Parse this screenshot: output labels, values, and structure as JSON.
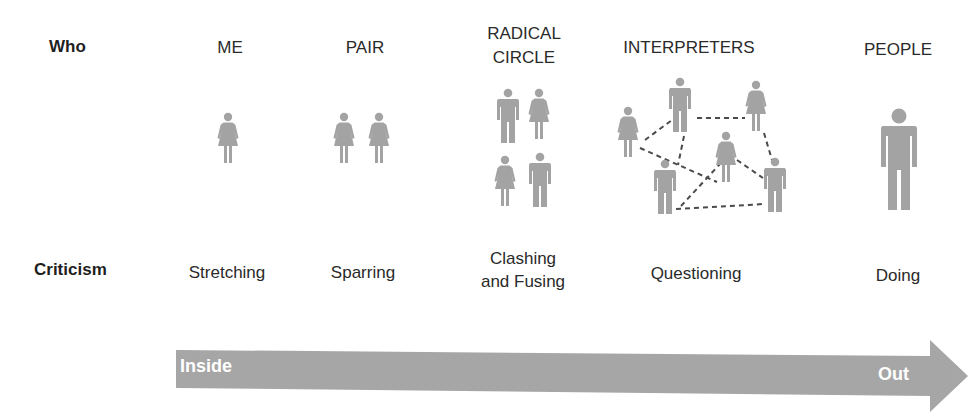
{
  "row_labels": {
    "who": "Who",
    "criticism": "Criticism"
  },
  "columns": [
    {
      "who": "ME",
      "criticism": "Stretching",
      "figures": [
        "female"
      ]
    },
    {
      "who": "PAIR",
      "criticism": "Sparring",
      "figures": [
        "female",
        "female"
      ]
    },
    {
      "who_line1": "RADICAL",
      "who_line2": "CIRCLE",
      "criticism_line1": "Clashing",
      "criticism_line2": "and Fusing",
      "figures": [
        "male",
        "female",
        "female",
        "male"
      ]
    },
    {
      "who": "INTERPRETERS",
      "criticism": "Questioning",
      "figures": [
        "female",
        "male",
        "female",
        "female",
        "male",
        "male"
      ],
      "connections": "dashed-network"
    },
    {
      "who": "PEOPLE",
      "criticism": "Doing",
      "figures": [
        "male-large"
      ]
    }
  ],
  "arrow": {
    "start_label": "Inside",
    "end_label": "Out",
    "color": "#a6a6a6"
  },
  "colors": {
    "figure": "#a3a3a3",
    "text": "#2a2a2a",
    "dash": "#444444"
  }
}
